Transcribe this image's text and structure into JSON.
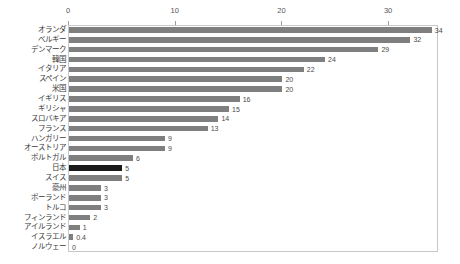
{
  "chart_data": {
    "type": "bar",
    "orientation": "horizontal",
    "title": "",
    "subtitle": "",
    "xlabel": "",
    "ylabel": "",
    "xlim": [
      0,
      34.6
    ],
    "xticks": [
      0,
      10,
      20,
      30
    ],
    "xtick_labels": [
      "0",
      "10",
      "20",
      "30"
    ],
    "grid": false,
    "legend": null,
    "axis_position": "top",
    "categories": [
      "オランダ",
      "ベルギー",
      "デンマーク",
      "韓国",
      "イタリア",
      "スペイン",
      "米国",
      "イギリス",
      "ギリシャ",
      "スロバキア",
      "フランス",
      "ハンガリー",
      "オーストリア",
      "ポルトガル",
      "日本",
      "スイス",
      "豪州",
      "ポーランド",
      "トルコ",
      "フィンランド",
      "アイルランド",
      "イスラエル",
      "ノルウェー"
    ],
    "values": [
      34,
      32,
      29,
      24,
      22,
      20,
      20,
      16,
      15,
      14,
      13,
      9,
      9,
      6,
      5,
      5,
      3,
      3,
      3,
      2,
      1,
      0.4,
      0
    ],
    "value_labels": [
      "34",
      "32",
      "29",
      "24",
      "22",
      "20",
      "20",
      "16",
      "15",
      "14",
      "13",
      "9",
      "9",
      "6",
      "5",
      "5",
      "3",
      "3",
      "3",
      "2",
      "1",
      "0.4",
      "0"
    ],
    "highlight_index": 14,
    "colors": {
      "bar": "#7f7f7f",
      "bar_highlight": "#1a1a1a",
      "frame": "#c8c8c8",
      "text": "#3a3a3a",
      "tick_text": "#555555",
      "background": "#ffffff"
    }
  }
}
